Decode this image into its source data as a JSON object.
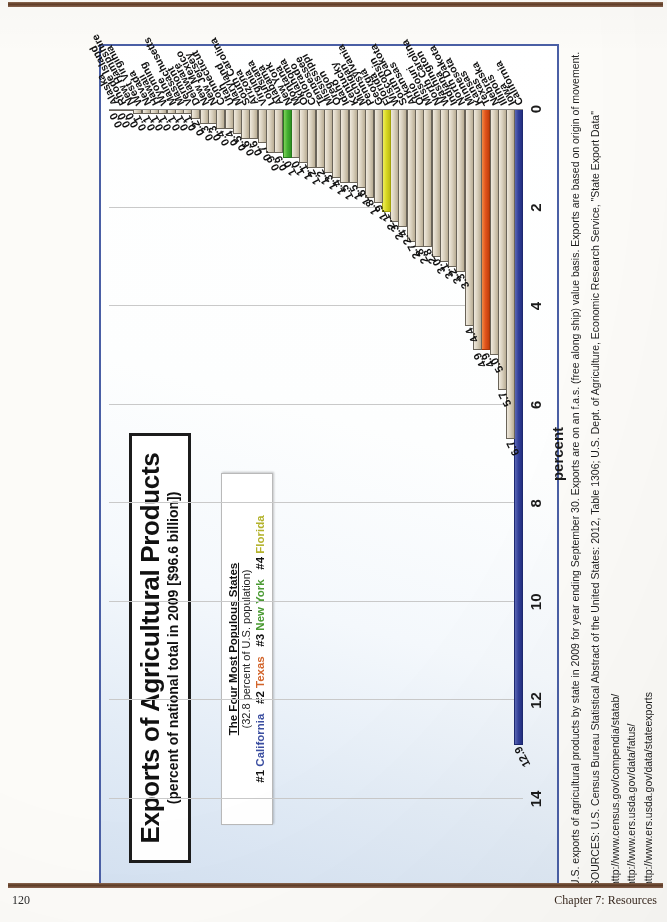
{
  "page": {
    "footer_page_number": "120",
    "footer_chapter": "Chapter 7: Resources"
  },
  "figure": {
    "title": "Exports of Agricultural Products",
    "subtitle": "(percent of national total in 2009 [$96.6 billion])",
    "legend": {
      "heading": "The Four Most Populous States",
      "subheading": "(32.8 percent of U.S. population)",
      "rank1_prefix": "#1",
      "rank1_state": "California",
      "rank2_prefix": "#2",
      "rank2_state": "Texas",
      "rank3_prefix": "#3",
      "rank3_state": "New York",
      "rank4_prefix": "#4",
      "rank4_state": "Florida"
    },
    "colors": {
      "california": "#33409a",
      "texas": "#e2541c",
      "new_york": "#45b132",
      "florida": "#d8d822",
      "default_bar": "#d9d0bd",
      "frame": "#4a5fa5"
    }
  },
  "notes": {
    "line1": "U.S. exports of agricultural products by state in 2009 for year ending September 30.  Exports are on an f.a.s. (free along ship) value basis.  Exports are based on origin of movement.",
    "line2": "SOURCES: U.S. Census Bureau Statistical Abstract of the United States: 2012, Table 1306; U.S. Dept. of Agriculture, Economic Research Service, \"State Export Data\"",
    "url1": "http://www.census.gov/compendia/statab/",
    "url2": "http://www.ers.usda.gov/data/fatus/",
    "url3": "http://www.ers.usda.gov/data/stateexports"
  },
  "chart_data": {
    "type": "bar",
    "orientation": "vertical-rotated",
    "title": "Exports of Agricultural Products",
    "subtitle": "(percent of national total in 2009 [$96.6 billion])",
    "xlabel": "",
    "ylabel": "percent",
    "ylim": [
      0,
      14
    ],
    "yticks": [
      0,
      2,
      4,
      6,
      8,
      10,
      12,
      14
    ],
    "grid": true,
    "legend_position": "top-left",
    "categories": [
      "California",
      "Iowa",
      "Illinois",
      "Nebraska",
      "Texas",
      "Kansas",
      "Minnesota",
      "North Dakota",
      "Indiana",
      "Washington",
      "North Carolina",
      "Missouri",
      "Ohio",
      "Arkansas",
      "South Dakota",
      "Wisconsin",
      "Florida",
      "Georgia",
      "Pennsylvania",
      "Michigan",
      "Kentucky",
      "Idaho",
      "Oregon",
      "Mississippi",
      "Tennessee",
      "Colorado",
      "Oklahoma",
      "Montana",
      "New York",
      "Alabama",
      "Louisiana",
      "Virginia",
      "Arizona",
      "South Carolina",
      "Maryland",
      "Utah",
      "Connecticut",
      "New Jersey",
      "New Mexico",
      "Delaware",
      "Vermont",
      "Massachusetts",
      "Maine",
      "Wyoming",
      "Hawaii",
      "Nevada",
      "West Virginia",
      "New Hampshire",
      "Rhode Island",
      "Alaska"
    ],
    "values": [
      12.9,
      6.7,
      5.7,
      5.0,
      4.9,
      4.9,
      4.4,
      3.3,
      3.2,
      3.1,
      3.0,
      2.8,
      2.8,
      2.7,
      2.4,
      2.3,
      2.1,
      1.9,
      1.8,
      1.6,
      1.5,
      1.5,
      1.4,
      1.3,
      1.2,
      1.2,
      1.1,
      1.0,
      1.0,
      0.9,
      0.9,
      0.7,
      0.6,
      0.6,
      0.5,
      0.4,
      0.4,
      0.3,
      0.3,
      0.2,
      0.1,
      0.1,
      0.1,
      0.1,
      0.1,
      0.1,
      0.1,
      0.0,
      0.0,
      0.0
    ],
    "highlights": {
      "California": "#33409a",
      "Texas": "#e2541c",
      "New York": "#45b132",
      "Florida": "#d8d822"
    }
  }
}
